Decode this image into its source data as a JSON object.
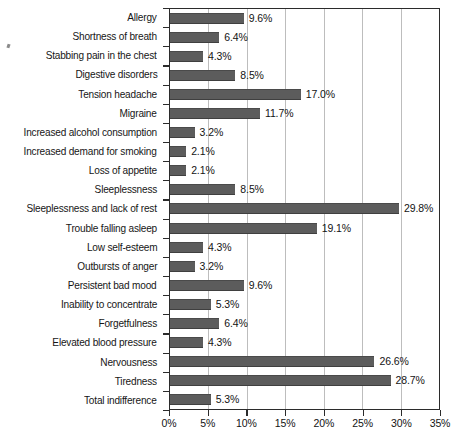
{
  "chart_data": {
    "type": "bar",
    "orientation": "horizontal",
    "title": "",
    "subtitle": "",
    "xlabel": "",
    "ylabel": "",
    "xlim": [
      0,
      35
    ],
    "xtick_labels": [
      "0%",
      "5%",
      "10%",
      "15%",
      "20%",
      "25%",
      "30%",
      "35%"
    ],
    "xtick_values": [
      0,
      5,
      10,
      15,
      20,
      25,
      30,
      35
    ],
    "grid": "vertical",
    "legend": "none",
    "value_label_suffix": "%",
    "bar_color": "#5c5c5c",
    "axis_color": "#2b2b2b",
    "gridline_color": "#bdbdbd",
    "categories": [
      "Allergy",
      "Shortness of breath",
      "Stabbing pain in the chest",
      "Digestive disorders",
      "Tension headache",
      "Migraine",
      "Increased alcohol consumption",
      "Increased demand for smoking",
      "Loss of appetite",
      "Sleeplessness",
      "Sleeplessness and lack of rest",
      "Trouble falling asleep",
      "Low self-esteem",
      "Outbursts of anger",
      "Persistent bad mood",
      "Inability to concentrate",
      "Forgetfulness",
      "Elevated blood pressure",
      "Nervousness",
      "Tiredness",
      "Total indifference"
    ],
    "values": [
      9.6,
      6.4,
      4.3,
      8.5,
      17.0,
      11.7,
      3.2,
      2.1,
      2.1,
      8.5,
      29.8,
      19.1,
      4.3,
      3.2,
      9.6,
      5.3,
      6.4,
      4.3,
      26.6,
      28.7,
      5.3
    ],
    "value_labels": [
      "9.6%",
      "6.4%",
      "4.3%",
      "8.5%",
      "17.0%",
      "11.7%",
      "3.2%",
      "2.1%",
      "2.1%",
      "8.5%",
      "29.8%",
      "19.1%",
      "4.3%",
      "3.2%",
      "9.6%",
      "5.3%",
      "6.4%",
      "4.3%",
      "26.6%",
      "28.7%",
      "5.3%"
    ]
  }
}
